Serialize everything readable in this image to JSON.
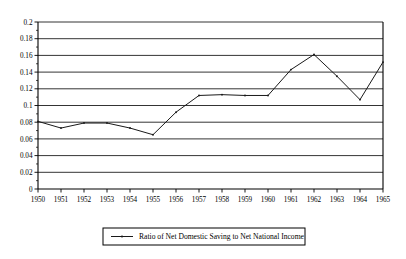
{
  "chart_data": {
    "type": "line",
    "title": "",
    "xlabel": "",
    "ylabel": "",
    "grid": "horizontal",
    "legend_position": "bottom-center",
    "xlim": [
      1950,
      1965
    ],
    "ylim": [
      0,
      0.2
    ],
    "ytick_step": 0.02,
    "categories": [
      "1950",
      "1951",
      "1952",
      "1953",
      "1954",
      "1955",
      "1956",
      "1957",
      "1958",
      "1959",
      "1960",
      "1961",
      "1962",
      "1963",
      "1964",
      "1965"
    ],
    "x": [
      1950,
      1951,
      1952,
      1953,
      1954,
      1955,
      1956,
      1957,
      1958,
      1959,
      1960,
      1961,
      1962,
      1963,
      1964,
      1965
    ],
    "yticks": [
      "0",
      "0.02",
      "0.04",
      "0.06",
      "0.08",
      "0.1",
      "0.12",
      "0.14",
      "0.16",
      "0.18",
      "0.2"
    ],
    "ytick_values": [
      0,
      0.02,
      0.04,
      0.06,
      0.08,
      0.1,
      0.12,
      0.14,
      0.16,
      0.18,
      0.2
    ],
    "series": [
      {
        "name": "Ratio of Net Domestic Saving to Net National Income",
        "values": [
          0.081,
          0.073,
          0.079,
          0.079,
          0.073,
          0.065,
          0.092,
          0.112,
          0.113,
          0.112,
          0.112,
          0.143,
          0.161,
          0.135,
          0.107,
          0.152
        ],
        "color": "#1a1a1a",
        "marker": "dot"
      }
    ]
  },
  "legend": {
    "entries": [
      {
        "label": "Ratio of Net Domestic Saving to Net National Income"
      }
    ]
  }
}
